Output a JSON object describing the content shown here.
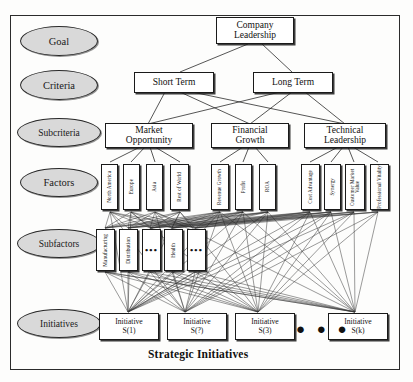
{
  "diagram": {
    "title": "Strategic Initiatives",
    "frame": {
      "border_color": "#2b2b2b"
    },
    "levels": [
      {
        "name": "goal",
        "label": "Goal"
      },
      {
        "name": "criteria",
        "label": "Criteria"
      },
      {
        "name": "subcriteria",
        "label": "Subcriteria"
      },
      {
        "name": "factors",
        "label": "Factors"
      },
      {
        "name": "subfactors",
        "label": "Subfactors"
      },
      {
        "name": "initiatives",
        "label": "Initiatives"
      }
    ],
    "goal": {
      "label": "Company\nLeadership",
      "line1": "Company",
      "line2": "Leadership"
    },
    "criteria": [
      {
        "label": "Short Term"
      },
      {
        "label": "Long Term"
      }
    ],
    "subcriteria": [
      {
        "line1": "Market",
        "line2": "Opportunity"
      },
      {
        "line1": "Financial",
        "line2": "Growth"
      },
      {
        "line1": "Technical",
        "line2": "Leadership"
      }
    ],
    "factors": {
      "market_opportunity": [
        {
          "label": "North America"
        },
        {
          "label": "Europe"
        },
        {
          "label": "Asia"
        },
        {
          "label": "Rest of World"
        }
      ],
      "financial_growth": [
        {
          "label": "Revenue Growth"
        },
        {
          "label": "Profit"
        },
        {
          "label": "ROA"
        }
      ],
      "technical_leadership": [
        {
          "label": "Cost Advantage"
        },
        {
          "label": "Synergy"
        },
        {
          "label": "Customer Market Value"
        },
        {
          "label": "Professional Vitality"
        }
      ]
    },
    "subfactors": [
      {
        "label": "Manufacturing",
        "type": "text"
      },
      {
        "label": "Distribution",
        "type": "text"
      },
      {
        "label": "•••",
        "type": "ellipsis"
      },
      {
        "label": "Health",
        "type": "text"
      },
      {
        "label": "•••",
        "type": "ellipsis"
      }
    ],
    "initiatives": [
      {
        "line1": "Initiative",
        "line2": "S(1)"
      },
      {
        "line1": "Initiative",
        "line2": "S(?)"
      },
      {
        "line1": "Initiative",
        "line2": "S(3)"
      },
      {
        "line1": "Initiative",
        "line2": "S(k)"
      }
    ],
    "initiatives_ellipsis": "● ● ●",
    "colors": {
      "ellipse_fill": "#d9d9d9",
      "node_fill": "#ffffff",
      "stroke": "#1a1a1a",
      "text": "#111111",
      "background": "#fdfdfc"
    }
  }
}
